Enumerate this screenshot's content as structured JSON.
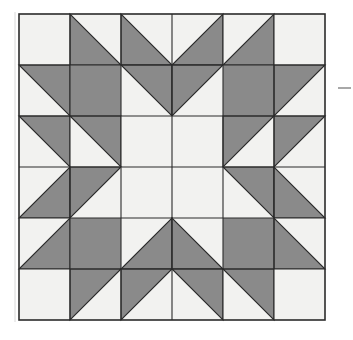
{
  "figure": {
    "name": "quilt-block-diagram",
    "grid_rows": 6,
    "grid_cols": 6,
    "colors": {
      "light": "#f2f2f0",
      "dark": "#8a8a8a",
      "outline": "#2b2b2b",
      "background": "#ffffff"
    },
    "geometry": {
      "left": 19,
      "top": 14,
      "width": 306,
      "height": 306,
      "cell": 51,
      "outline_width": 1.1,
      "border_width": 1.6
    },
    "cells": [
      [
        {
          "fill": "light",
          "tri": "none"
        },
        {
          "fill": "light",
          "tri": "bottom-left"
        },
        {
          "fill": "light",
          "tri": "bottom-left"
        },
        {
          "fill": "light",
          "tri": "bottom-right"
        },
        {
          "fill": "light",
          "tri": "bottom-right"
        },
        {
          "fill": "light",
          "tri": "none"
        }
      ],
      [
        {
          "fill": "light",
          "tri": "top-right"
        },
        {
          "fill": "dark",
          "tri": "solid"
        },
        {
          "fill": "light",
          "tri": "top-right"
        },
        {
          "fill": "light",
          "tri": "top-left"
        },
        {
          "fill": "dark",
          "tri": "solid"
        },
        {
          "fill": "light",
          "tri": "top-left"
        }
      ],
      [
        {
          "fill": "light",
          "tri": "top-right"
        },
        {
          "fill": "light",
          "tri": "top-right"
        },
        {
          "fill": "light",
          "tri": "none"
        },
        {
          "fill": "light",
          "tri": "none"
        },
        {
          "fill": "light",
          "tri": "top-left"
        },
        {
          "fill": "light",
          "tri": "top-left"
        }
      ],
      [
        {
          "fill": "light",
          "tri": "bottom-right"
        },
        {
          "fill": "light",
          "tri": "top-left"
        },
        {
          "fill": "light",
          "tri": "none"
        },
        {
          "fill": "light",
          "tri": "none"
        },
        {
          "fill": "light",
          "tri": "top-right"
        },
        {
          "fill": "light",
          "tri": "bottom-left"
        }
      ],
      [
        {
          "fill": "light",
          "tri": "bottom-right"
        },
        {
          "fill": "dark",
          "tri": "solid"
        },
        {
          "fill": "light",
          "tri": "bottom-right"
        },
        {
          "fill": "light",
          "tri": "bottom-left"
        },
        {
          "fill": "dark",
          "tri": "solid"
        },
        {
          "fill": "light",
          "tri": "bottom-left"
        }
      ],
      [
        {
          "fill": "light",
          "tri": "none"
        },
        {
          "fill": "light",
          "tri": "top-left"
        },
        {
          "fill": "light",
          "tri": "top-left"
        },
        {
          "fill": "light",
          "tri": "top-right"
        },
        {
          "fill": "light",
          "tri": "top-right"
        },
        {
          "fill": "light",
          "tri": "none"
        }
      ]
    ],
    "margin_mark": {
      "name": "right-margin-tick",
      "x1": 338,
      "y1": 88,
      "x2": 351,
      "y2": 88,
      "color": "#6e6e6e",
      "width": 1.2
    },
    "left_edge_mark": {
      "name": "left-margin-rule",
      "x1": 15,
      "y1": 12,
      "x2": 15,
      "y2": 322,
      "color": "#d8d8d8",
      "width": 1
    }
  }
}
